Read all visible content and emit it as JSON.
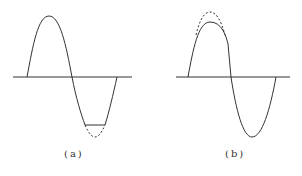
{
  "figures": [
    {
      "id": "a",
      "caption": "(a)",
      "description": "Sine wave with negative half-cycle clipped flat (dashed line shows original trough)"
    },
    {
      "id": "b",
      "caption": "(b)",
      "description": "Sine wave with positive peak compressed (dashed line shows original peak)"
    }
  ],
  "colors": {
    "line": "#333333",
    "dashed": "#555555"
  }
}
